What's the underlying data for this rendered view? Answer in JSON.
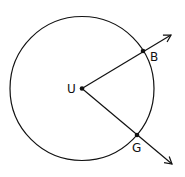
{
  "diagram": {
    "circle": {
      "cx": 82,
      "cy": 88.5,
      "r": 72,
      "stroke": "#111111"
    },
    "center": {
      "label": "U",
      "x": 82,
      "y": 88.5
    },
    "points": [
      {
        "label": "B",
        "x": 143,
        "y": 51
      },
      {
        "label": "G",
        "x": 137,
        "y": 135
      }
    ],
    "rays": [
      {
        "from": "U",
        "through": "B",
        "end": [
          171,
          34
        ]
      },
      {
        "from": "U",
        "through": "G",
        "end": [
          172,
          164
        ]
      }
    ]
  }
}
